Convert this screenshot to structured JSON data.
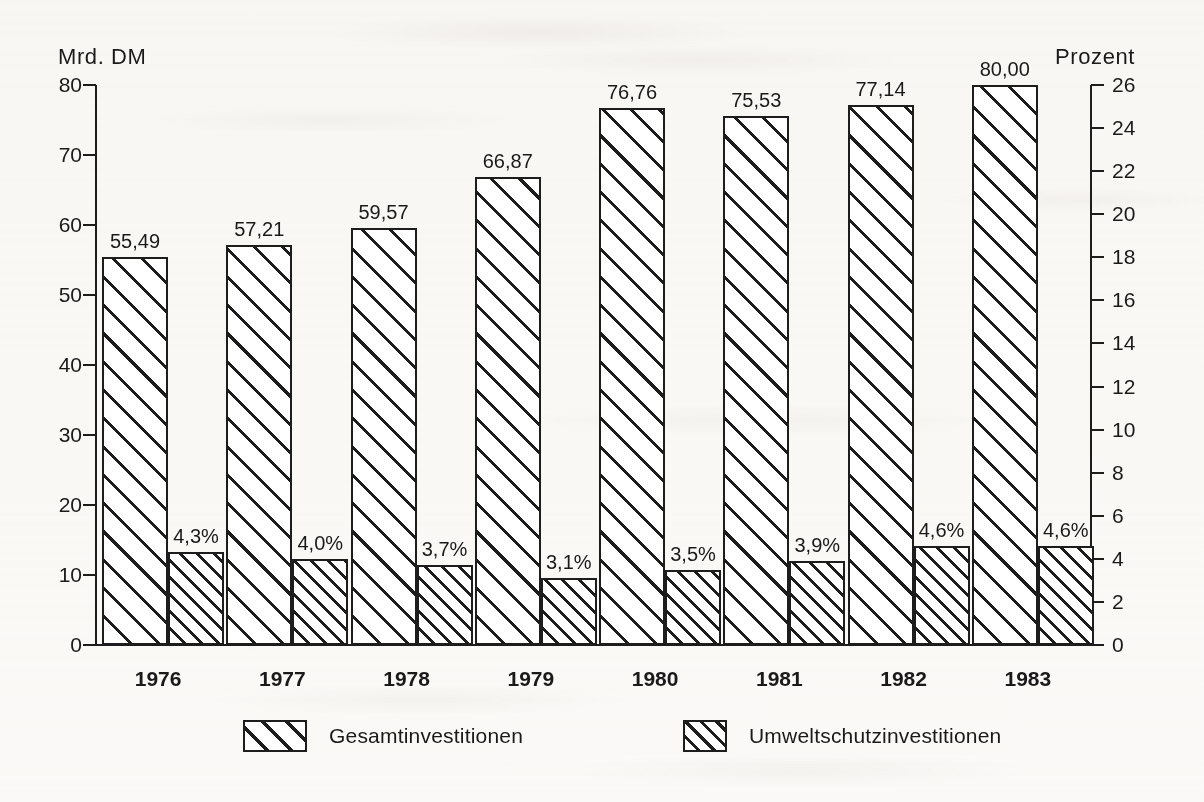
{
  "chart_data": {
    "type": "bar",
    "title": "",
    "subtitle": "",
    "categories": [
      "1976",
      "1977",
      "1978",
      "1979",
      "1980",
      "1981",
      "1982",
      "1983"
    ],
    "series": [
      {
        "name": "Gesamtinvestitionen",
        "unit": "Mrd. DM",
        "axis": "left",
        "values": [
          55.49,
          57.21,
          59.57,
          66.87,
          76.76,
          75.53,
          77.14,
          80.0
        ],
        "labels": [
          "55,49",
          "57,21",
          "59,57",
          "66,87",
          "76,76",
          "75,53",
          "77,14",
          "80,00"
        ]
      },
      {
        "name": "Umweltschutzinvestitionen",
        "unit": "Prozent",
        "axis": "right",
        "values": [
          4.3,
          4.0,
          3.7,
          3.1,
          3.5,
          3.9,
          4.6,
          4.6
        ],
        "labels": [
          "4,3%",
          "4,0%",
          "3,7%",
          "3,1%",
          "3,5%",
          "3,9%",
          "4,6%",
          "4,6%"
        ]
      }
    ],
    "xlabel": "",
    "ylabel": "Mrd. DM",
    "y2label": "Prozent",
    "ylim": [
      0,
      80
    ],
    "y2lim": [
      0,
      26
    ],
    "yticks": [
      0,
      10,
      20,
      30,
      40,
      50,
      60,
      70,
      80
    ],
    "y2ticks": [
      0,
      2,
      4,
      6,
      8,
      10,
      12,
      14,
      16,
      18,
      20,
      22,
      24,
      26
    ],
    "grid": false,
    "legend_position": "bottom",
    "colors": {
      "ink": "#1d1d1d",
      "paper": "#fbfaf8"
    }
  },
  "axes": {
    "left_title": "Mrd. DM",
    "right_title": "Prozent",
    "left_ticks": [
      "0",
      "10",
      "20",
      "30",
      "40",
      "50",
      "60",
      "70",
      "80"
    ],
    "right_ticks": [
      "0",
      "2",
      "4",
      "6",
      "8",
      "10",
      "12",
      "14",
      "16",
      "18",
      "20",
      "22",
      "24",
      "26"
    ]
  },
  "legend": {
    "entries": [
      {
        "label": "Gesamtinvestitionen",
        "pattern": "wide-hatch"
      },
      {
        "label": "Umweltschutzinvestitionen",
        "pattern": "dense-hatch"
      }
    ]
  }
}
